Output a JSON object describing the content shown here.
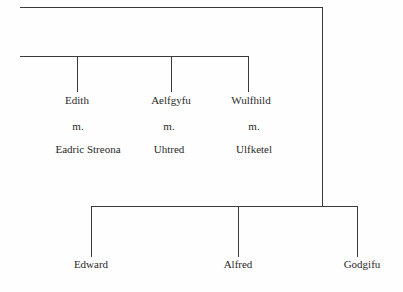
{
  "diagram": {
    "type": "family-tree",
    "generation_1": [
      {
        "name": "Edith",
        "marriage": "m.",
        "spouse": "Eadric Streona"
      },
      {
        "name": "Aelfgyfu",
        "marriage": "m.",
        "spouse": "Uhtred"
      },
      {
        "name": "Wulfhild",
        "marriage": "m.",
        "spouse": "Ulfketel"
      }
    ],
    "generation_2": [
      {
        "name": "Edward"
      },
      {
        "name": "Alfred"
      },
      {
        "name": "Godgifu"
      }
    ]
  }
}
